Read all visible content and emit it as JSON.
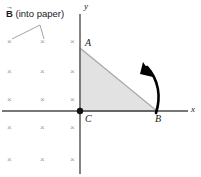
{
  "figure": {
    "background_color": "#ffffff"
  },
  "axes": {
    "x_label": "x",
    "y_label": "y",
    "color": "#4a4a4a",
    "origin": {
      "x": 80,
      "y": 111
    }
  },
  "annotation": {
    "field_label_symbol": "B",
    "field_label_arrow": "→",
    "field_label_text": "(into paper)",
    "field_direction": "into paper",
    "leader_apex": {
      "x": 40,
      "y": 25
    }
  },
  "vertices": [
    {
      "name": "A",
      "label": "A",
      "x": 80,
      "y": 48,
      "label_dx": 4,
      "label_dy": -11
    },
    {
      "name": "B",
      "label": "B",
      "x": 157,
      "y": 111,
      "label_dx": -2,
      "label_dy": 3
    },
    {
      "name": "C",
      "label": "C",
      "x": 80,
      "y": 111,
      "label_dx": 4,
      "label_dy": 3
    }
  ],
  "triangle": {
    "fill_color": "#e2e2e2",
    "stroke_color": "#a8a8a8",
    "points": "80,48 157,111 80,111"
  },
  "origin_dot": {
    "name": "origin-dot",
    "color": "#111111",
    "radius": 3.2
  },
  "rotation_arrow": {
    "name": "rotation-arrow",
    "direction": "counterclockwise",
    "color": "#000000",
    "path": "M 156,112 C 160,96 158,80 146,66",
    "head_points": "146,64 152,76 139,73"
  },
  "field_marks": {
    "symbol": "×",
    "color": "#9a9a9a",
    "columns_x": [
      10,
      43,
      73
    ],
    "rows_y": [
      42,
      72,
      100,
      128,
      160
    ],
    "count": 15
  }
}
